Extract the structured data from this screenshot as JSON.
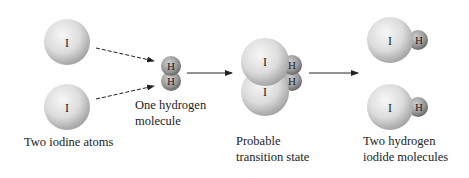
{
  "diagram": {
    "title": "",
    "atoms": {
      "iodine_symbol": "I",
      "hydrogen_symbol": "H"
    },
    "stages": [
      {
        "id": "reactant-iodine",
        "label_lines": [
          "Two iodine atoms"
        ]
      },
      {
        "id": "reactant-hydrogen",
        "label_lines": [
          "One hydrogen",
          "molecule"
        ]
      },
      {
        "id": "transition-state",
        "label_lines": [
          "Probable",
          "transition state"
        ]
      },
      {
        "id": "products",
        "label_lines": [
          "Two hydrogen",
          "iodide molecules"
        ]
      }
    ],
    "arrows": [
      {
        "from": "iodine-top",
        "to": "hydrogen-molecule",
        "style": "dashed"
      },
      {
        "from": "iodine-bottom",
        "to": "hydrogen-molecule",
        "style": "dashed"
      },
      {
        "from": "hydrogen-molecule",
        "to": "transition-state",
        "style": "solid"
      },
      {
        "from": "transition-state",
        "to": "products",
        "style": "solid"
      }
    ],
    "colors": {
      "iodine": "#d9d9d9",
      "hydrogen": "#9a9a9a",
      "arrow": "#222222",
      "text": "#222222"
    }
  }
}
